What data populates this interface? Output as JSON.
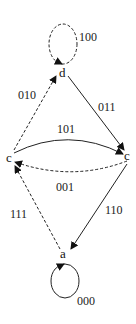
{
  "diagram": {
    "type": "state-transition-graph",
    "nodes": [
      {
        "id": "d",
        "label": "d"
      },
      {
        "id": "c_left",
        "label": "c"
      },
      {
        "id": "c_right",
        "label": "c"
      },
      {
        "id": "a",
        "label": "a"
      }
    ],
    "edges": [
      {
        "from": "d",
        "to": "d",
        "label": "100",
        "style": "dashed"
      },
      {
        "from": "c_left",
        "to": "d",
        "label": "010",
        "style": "dashed"
      },
      {
        "from": "d",
        "to": "c_right",
        "label": "011",
        "style": "solid"
      },
      {
        "from": "c_left",
        "to": "c_right",
        "label": "101",
        "style": "solid"
      },
      {
        "from": "c_right",
        "to": "c_left",
        "label": "001",
        "style": "dashed"
      },
      {
        "from": "a",
        "to": "c_left",
        "label": "111",
        "style": "dashed"
      },
      {
        "from": "c_right",
        "to": "a",
        "label": "110",
        "style": "solid"
      },
      {
        "from": "a",
        "to": "a",
        "label": "000",
        "style": "solid"
      }
    ]
  }
}
